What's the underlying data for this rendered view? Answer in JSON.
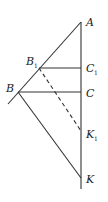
{
  "diagram": {
    "points": {
      "A": {
        "label": "A",
        "sub": "",
        "x": 81,
        "y": 22
      },
      "B1": {
        "label": "B",
        "sub": "1",
        "x": 39,
        "y": 68
      },
      "C1": {
        "label": "C",
        "sub": "1",
        "x": 81,
        "y": 68
      },
      "B": {
        "label": "B",
        "sub": "",
        "x": 18,
        "y": 92
      },
      "C": {
        "label": "C",
        "sub": "",
        "x": 81,
        "y": 92
      },
      "K1": {
        "label": "K",
        "sub": "1",
        "x": 81,
        "y": 131
      },
      "K": {
        "label": "K",
        "sub": "",
        "x": 81,
        "y": 178
      }
    },
    "segments": [
      {
        "from": "A",
        "to": "B",
        "style": "solid",
        "extends_past_B": true
      },
      {
        "from": "A",
        "to": "K",
        "style": "solid",
        "extends_past_K": true
      },
      {
        "from": "B1",
        "to": "C1",
        "style": "solid"
      },
      {
        "from": "B",
        "to": "C",
        "style": "solid"
      },
      {
        "from": "B",
        "to": "K",
        "style": "solid"
      },
      {
        "from": "B1",
        "to": "K1",
        "style": "dashed"
      }
    ],
    "colors": {
      "stroke": "#333333",
      "background": "#ffffff"
    }
  }
}
